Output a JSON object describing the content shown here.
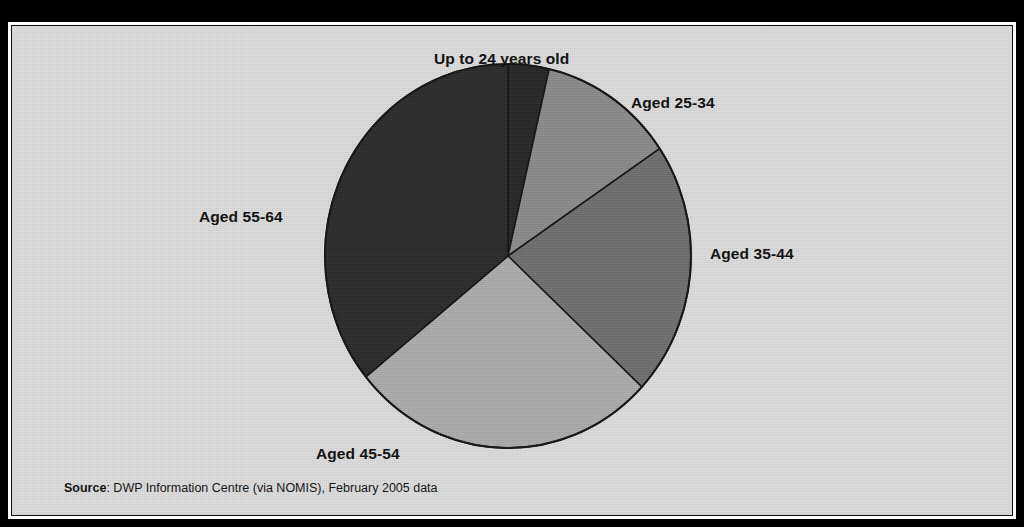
{
  "figure": {
    "title": "",
    "background_color": "#000000",
    "panel_color": "#dcdcdc",
    "panel_border_color": "#111111"
  },
  "source": {
    "label": "Source",
    "separator": ":",
    "text": " DWP Information Centre (via NOMIS), February 2005 data"
  },
  "chart_data": {
    "type": "pie",
    "title": "",
    "subtitle": "",
    "xlabel": "",
    "ylabel": "",
    "legend_position": "none",
    "labels_position": "outside",
    "grid": false,
    "start_angle_deg": 0,
    "direction": "clockwise",
    "categories": [
      "Up to 24 years old",
      "Aged 25-34",
      "Aged 35-44",
      "Aged 45-54",
      "Aged 55-64"
    ],
    "values": [
      3.6,
      11.9,
      21.4,
      27.2,
      35.9
    ],
    "unit": "percent",
    "slices": [
      {
        "label": "Up to 24 years old",
        "value": 3.6,
        "start_deg": 0.0,
        "end_deg": 13.0,
        "color": "#262626"
      },
      {
        "label": "Aged 25-34",
        "value": 11.9,
        "start_deg": 13.0,
        "end_deg": 56.0,
        "color": "#8a8a8a"
      },
      {
        "label": "Aged 35-44",
        "value": 21.4,
        "start_deg": 56.0,
        "end_deg": 133.0,
        "color": "#6f6f6f"
      },
      {
        "label": "Aged 45-54",
        "value": 27.2,
        "start_deg": 133.0,
        "end_deg": 231.0,
        "color": "#ababab"
      },
      {
        "label": "Aged 55-64",
        "value": 35.9,
        "start_deg": 231.0,
        "end_deg": 360.0,
        "color": "#2a2a2a"
      }
    ],
    "slice_outline_color": "#141414"
  }
}
